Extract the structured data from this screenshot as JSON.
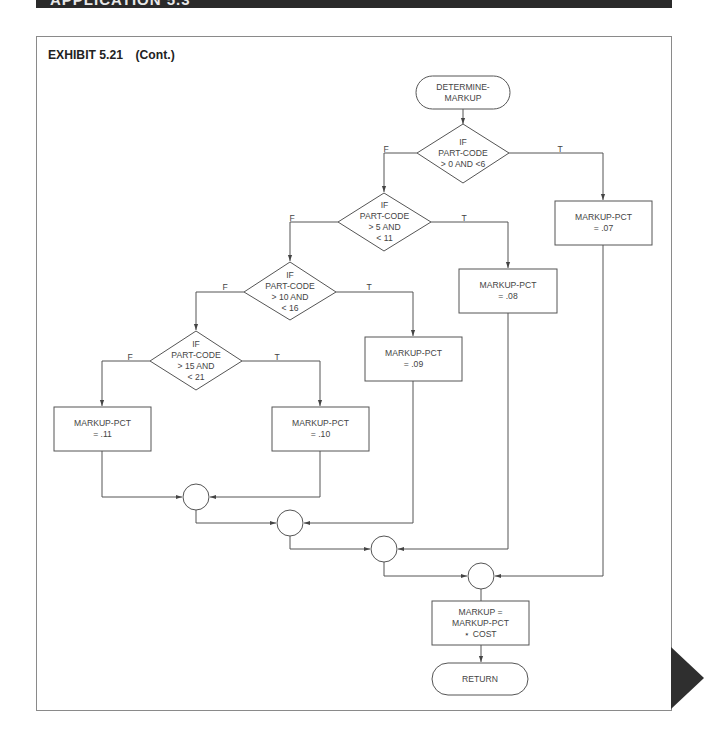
{
  "banner": {
    "text": "APPLICATION 5.3"
  },
  "exhibit": {
    "title": "EXHIBIT 5.21",
    "subtitle": "(Cont.)"
  },
  "flowchart": {
    "start": "DETERMINE-\nMARKUP",
    "decisions": [
      {
        "id": "d1",
        "text": "IF\nPART-CODE\n> 0 AND <6",
        "false_label": "F",
        "true_label": "T"
      },
      {
        "id": "d2",
        "text": "IF\nPART-CODE\n> 5 AND\n< 11",
        "false_label": "F",
        "true_label": "T"
      },
      {
        "id": "d3",
        "text": "IF\nPART-CODE\n> 10 AND\n< 16",
        "false_label": "F",
        "true_label": "T"
      },
      {
        "id": "d4",
        "text": "IF\nPART-CODE\n> 15 AND\n< 21",
        "false_label": "F",
        "true_label": "T"
      }
    ],
    "processes": [
      {
        "id": "p07",
        "text": "MARKUP-PCT\n= .07"
      },
      {
        "id": "p08",
        "text": "MARKUP-PCT\n= .08"
      },
      {
        "id": "p09",
        "text": "MARKUP-PCT\n= .09"
      },
      {
        "id": "p10",
        "text": "MARKUP-PCT\n= .10"
      },
      {
        "id": "p11",
        "text": "MARKUP-PCT\n= .11"
      }
    ],
    "compute": "MARKUP =\nMARKUP-PCT\n⋆ COST",
    "end": "RETURN",
    "connectors": 4
  },
  "colors": {
    "line": "#555555",
    "banner": "#2a2a2a",
    "triangle": "#2f2f2f",
    "frame": "#8a8a8a"
  }
}
